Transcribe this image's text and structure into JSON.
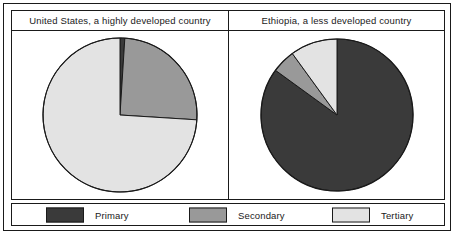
{
  "colors": {
    "primary": "#3a3a3a",
    "secondary": "#999999",
    "tertiary": "#e3e3e3",
    "outline": "#1a1a1a",
    "background": "#ffffff"
  },
  "panels": [
    {
      "title": "United States, a highly developed country",
      "chart_index": 0
    },
    {
      "title": "Ethiopia, a less developed country",
      "chart_index": 1
    }
  ],
  "legend": {
    "items": [
      {
        "label": "Primary",
        "color": "#3a3a3a"
      },
      {
        "label": "Secondary",
        "color": "#999999"
      },
      {
        "label": "Tertiary",
        "color": "#e3e3e3"
      }
    ]
  },
  "chart_data": [
    {
      "type": "pie",
      "title": "United States, a highly developed country",
      "labels": [
        "Primary",
        "Secondary",
        "Tertiary"
      ],
      "values": [
        1,
        25,
        74
      ],
      "colors": [
        "#3a3a3a",
        "#999999",
        "#e3e3e3"
      ],
      "start_angle_deg": 0,
      "direction": "clockwise",
      "legend_position": "bottom",
      "grid": false,
      "xlabel": "",
      "ylabel": ""
    },
    {
      "type": "pie",
      "title": "Ethiopia, a less developed country",
      "labels": [
        "Primary",
        "Secondary",
        "Tertiary"
      ],
      "values": [
        85,
        5,
        10
      ],
      "colors": [
        "#3a3a3a",
        "#999999",
        "#e3e3e3"
      ],
      "start_angle_deg": 0,
      "direction": "clockwise",
      "legend_position": "bottom",
      "grid": false,
      "xlabel": "",
      "ylabel": ""
    }
  ]
}
